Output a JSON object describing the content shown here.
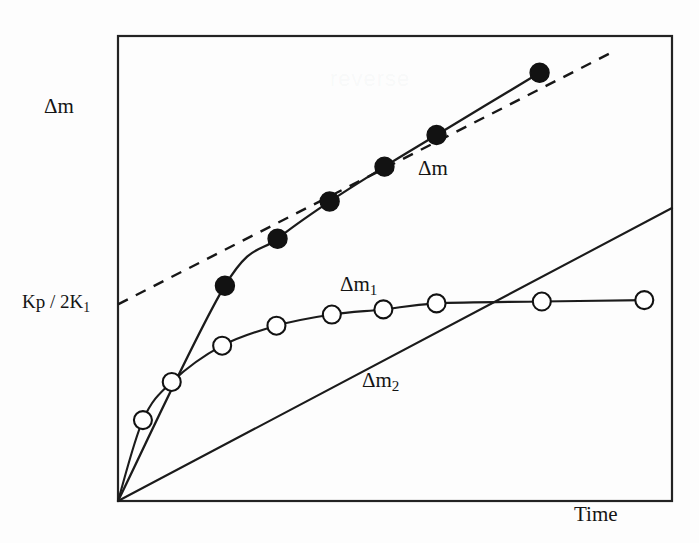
{
  "figure": {
    "background_color": "#fdfdfd",
    "ink_color": "#141414"
  },
  "labels": {
    "y_axis": "Δm",
    "x_axis": "Time",
    "intercept": "Kp / 2K",
    "intercept_subscript": "1",
    "curve_total_prefix": "Δm",
    "curve_one_prefix": "Δm",
    "curve_one_subscript": "1",
    "curve_two_prefix": "Δm",
    "curve_two_subscript": "2"
  },
  "chart_data": {
    "type": "line",
    "title": "",
    "xlabel": "Time",
    "ylabel": "Δm",
    "xlim": [
      0,
      100
    ],
    "ylim": [
      0,
      100
    ],
    "grid": false,
    "legend": "inline annotations",
    "axis_ticks": {
      "x": [],
      "y": [
        "Kp / 2K1"
      ]
    },
    "annotations": [
      {
        "text": "Δm",
        "x": 73,
        "y": 74,
        "note": "label on total mass-gain curve"
      },
      {
        "text": "Δm1",
        "x": 48,
        "y": 42,
        "note": "label on saturating curve"
      },
      {
        "text": "Δm2",
        "x": 44,
        "y": 28,
        "note": "label on linear curve"
      },
      {
        "text": "Kp / 2K1",
        "x": 0,
        "y": 42,
        "note": "y-intercept of the dashed asymptote"
      }
    ],
    "series": [
      {
        "name": "Δm",
        "style": "solid-curve-with-filled-circles",
        "marker": "filled-circle",
        "comment": "total mass gain = Δm1 + Δm2; parabolic at short times, linear at long times",
        "points": [
          {
            "x": 0.0,
            "y": 0.0
          },
          {
            "x": 19.3,
            "y": 46.3
          },
          {
            "x": 28.8,
            "y": 56.4
          },
          {
            "x": 38.2,
            "y": 64.4
          },
          {
            "x": 48.1,
            "y": 71.9
          },
          {
            "x": 57.5,
            "y": 78.7
          },
          {
            "x": 76.1,
            "y": 92.1
          }
        ],
        "marker_points": [
          {
            "x": 19.3,
            "y": 46.3
          },
          {
            "x": 28.8,
            "y": 56.4
          },
          {
            "x": 38.2,
            "y": 64.4
          },
          {
            "x": 48.1,
            "y": 71.9
          },
          {
            "x": 57.5,
            "y": 78.7
          },
          {
            "x": 76.1,
            "y": 92.1
          }
        ]
      },
      {
        "name": "asymptote",
        "style": "dashed-line",
        "marker": "none",
        "comment": "long-time linear asymptote of Δm, intercept Kp/2K1 on the ordinate",
        "points": [
          {
            "x": 0.0,
            "y": 42.3
          },
          {
            "x": 90.0,
            "y": 97.0
          }
        ]
      },
      {
        "name": "Δm1",
        "style": "solid-curve-with-open-circles",
        "marker": "open-circle",
        "comment": "saturating (paralinear) component approaching a plateau",
        "points": [
          {
            "x": 0.0,
            "y": 0.0
          },
          {
            "x": 4.5,
            "y": 17.4
          },
          {
            "x": 9.7,
            "y": 25.6
          },
          {
            "x": 18.8,
            "y": 33.4
          },
          {
            "x": 28.6,
            "y": 37.7
          },
          {
            "x": 38.6,
            "y": 40.1
          },
          {
            "x": 47.9,
            "y": 41.2
          },
          {
            "x": 57.5,
            "y": 42.5
          },
          {
            "x": 76.5,
            "y": 42.9
          },
          {
            "x": 95.0,
            "y": 43.2
          }
        ],
        "marker_points": [
          {
            "x": 4.5,
            "y": 17.4
          },
          {
            "x": 9.7,
            "y": 25.6
          },
          {
            "x": 18.8,
            "y": 33.4
          },
          {
            "x": 28.6,
            "y": 37.7
          },
          {
            "x": 38.6,
            "y": 40.1
          },
          {
            "x": 47.9,
            "y": 41.2
          },
          {
            "x": 57.5,
            "y": 42.5
          },
          {
            "x": 76.5,
            "y": 42.9
          },
          {
            "x": 95.0,
            "y": 43.2
          }
        ]
      },
      {
        "name": "Δm2",
        "style": "solid-straight-line",
        "marker": "none",
        "comment": "linear component, passes through the origin",
        "points": [
          {
            "x": 0.0,
            "y": 0.0
          },
          {
            "x": 100.0,
            "y": 63.0
          }
        ]
      }
    ]
  }
}
